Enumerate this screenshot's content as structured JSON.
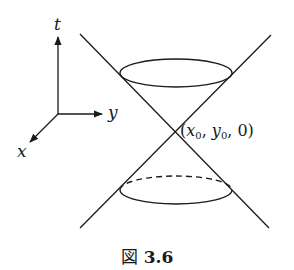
{
  "figure": {
    "caption_prefix": "図",
    "caption_number": "3.6"
  },
  "axes": {
    "t_label": "t",
    "y_label": "y",
    "x_label": "x"
  },
  "apex_label": {
    "open": "(",
    "x_var": "x",
    "x_sub": "0",
    "sep1": ", ",
    "y_var": "y",
    "y_sub": "0",
    "sep2": ", ",
    "t_val": "0",
    "close": ")"
  },
  "colors": {
    "stroke": "#1a1a1a",
    "background": "#ffffff"
  }
}
